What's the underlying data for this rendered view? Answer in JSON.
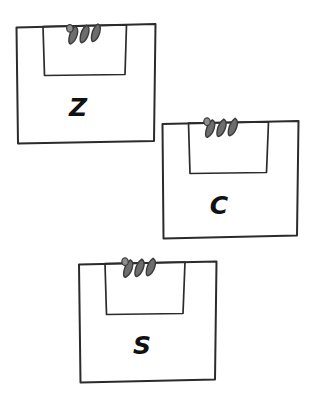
{
  "figure": {
    "title": "",
    "background_color": "#ffffff",
    "stroke_color": "#2b2b2b",
    "coil_fill_color": "#6d6d6d",
    "coil_stroke_color": "#3a3a3a",
    "label_color": "#111111",
    "item_count": 3
  },
  "items": [
    {
      "id": "bag-z",
      "label": "Z",
      "label_x": 78,
      "label_y": 109,
      "label_size": 25,
      "outer_path": "M16.5,27.5 L155.5,24.0 L154.0,141.0 L18.0,143.5 Z",
      "inner_path": "M43.0,26.5 L126.5,24.8 L125.0,74.5 L44.5,75.5 Z",
      "coil": {
        "x": 69,
        "y": 25,
        "width": 38,
        "height": 17,
        "loops": 3,
        "rotation": -6
      }
    },
    {
      "id": "bag-c",
      "label": "C",
      "label_x": 219,
      "label_y": 207,
      "label_size": 25,
      "outer_path": "M162.5,124.0 L298.5,121.0 L297.0,235.5 L163.5,238.5 Z",
      "inner_path": "M188.5,123.0 L268.5,121.8 L266.5,172.5 L190.0,173.5 Z",
      "coil": {
        "x": 206,
        "y": 119,
        "width": 38,
        "height": 17,
        "loops": 3,
        "rotation": -4
      }
    },
    {
      "id": "bag-s",
      "label": "S",
      "label_x": 142,
      "label_y": 347,
      "label_size": 25,
      "outer_path": "M79.0,264.5 L216.5,261.5 L215.0,379.5 L80.5,382.5 Z",
      "inner_path": "M105.0,263.5 L185.0,262.0 L183.0,313.5 L106.5,314.5 Z",
      "coil": {
        "x": 124,
        "y": 259,
        "width": 38,
        "height": 17,
        "loops": 3,
        "rotation": -4
      }
    }
  ]
}
